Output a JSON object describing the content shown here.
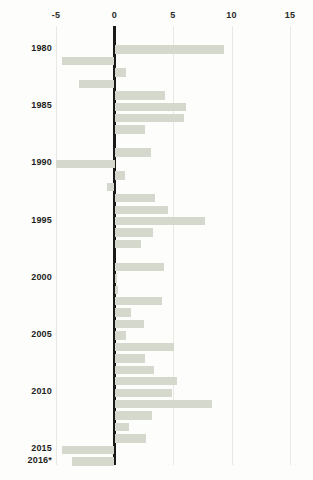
{
  "chart_data": {
    "type": "bar",
    "orientation": "horizontal",
    "title": "",
    "subtitle": "",
    "xlabel": "",
    "ylabel": "",
    "xlim": [
      -6.0,
      16.2
    ],
    "ylim": null,
    "grid": true,
    "legend": null,
    "legend_position": "none",
    "axis_ticks": [
      -5,
      0,
      5,
      10,
      15
    ],
    "axis_tick_labels": [
      "-5",
      "0",
      "5",
      "10",
      "15"
    ],
    "zero_line": 0,
    "bar_color": "#d5d8cc",
    "axis_color": "#1a1a18",
    "gridline_color": "#e9e9e4",
    "text_color": "#1f1f1d",
    "background_color": "#fdfdfc",
    "categories": [
      "1980",
      "1981",
      "1982",
      "1983",
      "1984",
      "1985",
      "1986",
      "1987",
      "1988",
      "1989",
      "1990",
      "1991",
      "1992",
      "1993",
      "1994",
      "1995",
      "1996",
      "1997",
      "1998",
      "1999",
      "2000",
      "2001",
      "2002",
      "2003",
      "2004",
      "2005",
      "2006",
      "2007",
      "2008",
      "2009",
      "2010",
      "2011",
      "2012",
      "2013",
      "2014",
      "2015",
      "2016*"
    ],
    "visible_category_labels": [
      "1980",
      "1985",
      "1990",
      "1995",
      "2000",
      "2005",
      "2010",
      "2015",
      "2016*"
    ],
    "values": [
      9.4,
      -4.5,
      1.0,
      -3.0,
      4.3,
      6.1,
      5.9,
      2.6,
      0.0,
      3.1,
      -5.0,
      0.9,
      -0.6,
      3.5,
      4.6,
      7.7,
      3.3,
      2.3,
      0.0,
      4.2,
      0.2,
      0.3,
      4.1,
      1.4,
      2.5,
      1.0,
      5.1,
      2.6,
      3.4,
      5.3,
      4.9,
      8.3,
      3.2,
      1.2,
      2.7,
      -4.5,
      -3.6
    ],
    "footnote_marker": "*"
  }
}
